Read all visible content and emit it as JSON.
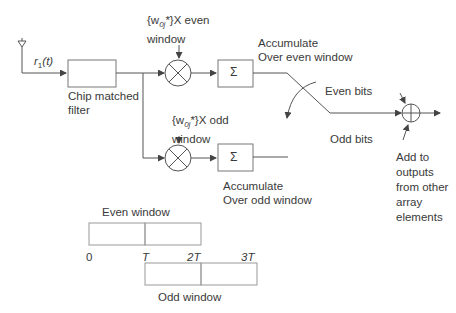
{
  "diagram": {
    "input_signal": "r1(t)",
    "input_symbol": "r",
    "input_subscript": "1",
    "input_arg": "(t)",
    "blocks": {
      "chip_filter": {
        "label_line1": "Chip matched",
        "label_line2": "filter"
      },
      "even_multiplier": {
        "label_prefix": "{w",
        "label_sub": "0j",
        "label_suffix": "*}X even",
        "label_line2": "window"
      },
      "odd_multiplier": {
        "label_prefix": "{w",
        "label_sub": "0j",
        "label_suffix": "*}X odd",
        "label_line2": "window"
      },
      "even_accumulator": {
        "symbol": "Σ",
        "label_line1": "Accumulate",
        "label_line2": "Over even window"
      },
      "odd_accumulator": {
        "symbol": "Σ",
        "label_line1": "Accumulate",
        "label_line2": "Over odd window"
      }
    },
    "switch": {
      "even_label": "Even bits",
      "odd_label": "Odd bits"
    },
    "summer": {
      "label_lines": [
        "Add to",
        "outputs",
        "from other",
        "array",
        "elements"
      ]
    },
    "timing": {
      "even_window_label": "Even window",
      "odd_window_label": "Odd window",
      "ticks": [
        "0",
        "T",
        "2T",
        "3T"
      ]
    }
  },
  "colors": {
    "line": "#555555",
    "text": "#3a3a3a",
    "box": "#888888"
  }
}
